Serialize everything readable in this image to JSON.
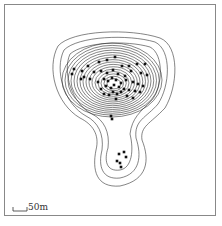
{
  "figure": {
    "scale_bar": {
      "label": "50m"
    },
    "contours": {
      "upper_lobe_count": 16,
      "lower_lobe_count": 3,
      "stroke_color": "#333333"
    },
    "points": {
      "color": "#111111",
      "upper_cluster": [
        [
          74,
          69
        ],
        [
          72,
          74
        ],
        [
          82,
          71
        ],
        [
          88,
          66
        ],
        [
          99,
          62
        ],
        [
          107,
          60
        ],
        [
          115,
          57
        ],
        [
          122,
          66
        ],
        [
          129,
          66
        ],
        [
          137,
          64
        ],
        [
          145,
          64
        ],
        [
          81,
          79
        ],
        [
          84,
          77
        ],
        [
          90,
          79
        ],
        [
          94,
          72
        ],
        [
          101,
          71
        ],
        [
          107,
          73
        ],
        [
          113,
          70
        ],
        [
          118,
          74
        ],
        [
          125,
          76
        ],
        [
          131,
          71
        ],
        [
          141,
          73
        ],
        [
          147,
          75
        ],
        [
          98,
          82
        ],
        [
          104,
          79
        ],
        [
          108,
          81
        ],
        [
          112,
          78
        ],
        [
          116,
          80
        ],
        [
          121,
          83
        ],
        [
          126,
          80
        ],
        [
          133,
          82
        ],
        [
          138,
          84
        ],
        [
          143,
          86
        ],
        [
          101,
          89
        ],
        [
          106,
          86
        ],
        [
          111,
          88
        ],
        [
          114,
          85
        ],
        [
          119,
          87
        ],
        [
          124,
          89
        ],
        [
          129,
          90
        ],
        [
          135,
          91
        ],
        [
          140,
          92
        ],
        [
          104,
          94
        ],
        [
          109,
          95
        ],
        [
          113,
          92
        ],
        [
          117,
          94
        ],
        [
          121,
          92
        ],
        [
          127,
          96
        ],
        [
          133,
          98
        ],
        [
          116,
          99
        ],
        [
          111,
          116
        ],
        [
          112,
          119
        ]
      ],
      "lower_cluster": [
        [
          119,
          154
        ],
        [
          124,
          152
        ],
        [
          126,
          157
        ],
        [
          117,
          161
        ],
        [
          120,
          163
        ],
        [
          121,
          167
        ]
      ]
    },
    "caption_left": "",
    "caption_right": ""
  }
}
